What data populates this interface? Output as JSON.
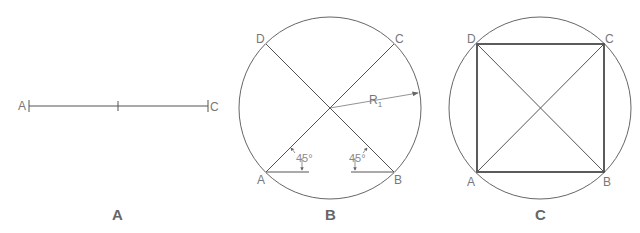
{
  "figure": {
    "panels": [
      {
        "caption": "A",
        "description": "Line segment AC bisected",
        "points": {
          "start": "A",
          "end": "C"
        }
      },
      {
        "caption": "B",
        "description": "Circle with diagonals at 45 degrees",
        "points": {
          "a": "A",
          "b": "B",
          "c": "C",
          "d": "D"
        },
        "radius_label": "R",
        "radius_subscript": "1",
        "angle_left": "45°",
        "angle_right": "45°"
      },
      {
        "caption": "C",
        "description": "Square inscribed in circle",
        "points": {
          "a": "A",
          "b": "B",
          "c": "C",
          "d": "D"
        }
      }
    ]
  }
}
